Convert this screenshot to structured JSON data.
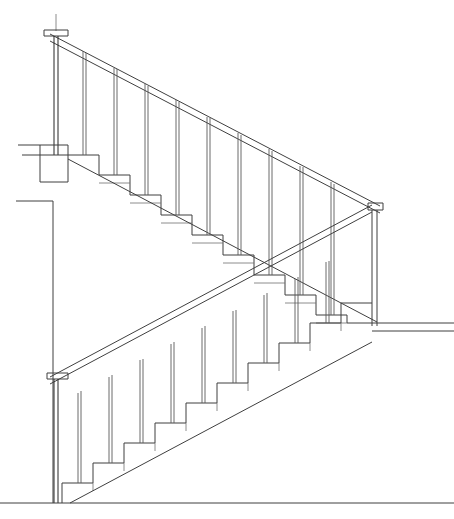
{
  "document": {
    "type": "technical-line-drawing",
    "subject": "staircase-section-elevation",
    "title": "Staircase Section Elevation",
    "background_color": "#ffffff",
    "line_color": "#3f3f3f",
    "dark_line_color": "#262626",
    "faint_line_color": "#6e6e6e",
    "canvas": {
      "width": 454,
      "height": 519
    }
  },
  "geometry": {
    "step_run": 31,
    "step_rise": 20,
    "handrail_thickness": 7,
    "baluster_width": 3,
    "newel_cap_height": 6
  },
  "upper_flight": {
    "label": "Upper flight descending left to right",
    "direction": "descending-right",
    "start_x": 68,
    "start_y": 155,
    "steps": 10,
    "newel_top": {
      "x": 44,
      "y": 30,
      "width": 24,
      "height": 6
    },
    "newel_post_x1": 54,
    "newel_post_x2": 59,
    "newel_post_top_y": 14,
    "newel_post_bottom_y": 155,
    "right_newel": {
      "x": 368,
      "y": 203,
      "width": 15,
      "height": 7
    },
    "right_newel_post_x1": 372,
    "right_newel_post_x2": 377,
    "right_newel_post_bottom_y": 326,
    "handrail_start": {
      "x": 50,
      "y": 34
    },
    "handrail_end": {
      "x": 380,
      "y": 206
    },
    "stringer_start": {
      "x": 68,
      "y": 159
    },
    "stringer_end": {
      "x": 377,
      "y": 322
    },
    "baluster_count": 9
  },
  "lower_flight": {
    "label": "Lower flight ascending left to right",
    "direction": "ascending-right",
    "start_x": 62,
    "start_y": 503,
    "steps": 10,
    "newel_top": {
      "x": 47,
      "y": 373,
      "width": 21,
      "height": 6
    },
    "newel_post_x1": 54,
    "newel_post_x2": 58,
    "newel_post_bottom_y": 503,
    "handrail_start": {
      "x": 50,
      "y": 377
    },
    "handrail_end": {
      "x": 372,
      "y": 205
    },
    "stringer_start": {
      "x": 70,
      "y": 503
    },
    "stringer_end": {
      "x": 372,
      "y": 342
    },
    "baluster_count": 9
  },
  "landing_upper": {
    "label": "Upper landing at left",
    "top_line": {
      "x1": 18,
      "y1": 145,
      "x2": 68,
      "y2": 145
    },
    "nosing_line": {
      "x1": 22,
      "y1": 155,
      "x2": 68,
      "y2": 155
    },
    "box": {
      "x": 40,
      "y": 145,
      "width": 28,
      "height": 37
    }
  },
  "wall_left": {
    "label": "Left wall section",
    "top_line": {
      "x1": 16,
      "y1": 201,
      "x2": 53,
      "y2": 201
    },
    "vertical_line": {
      "x": 53,
      "y1": 201,
      "y2": 503
    }
  },
  "floor": {
    "label": "Ground floor line",
    "y": 503,
    "x1": 0,
    "x2": 454
  },
  "landing_right": {
    "label": "Right landing / intermediate floor",
    "upper_line": {
      "x1": 377,
      "y1": 323,
      "x2": 454,
      "y2": 323
    },
    "lower_line": {
      "x1": 377,
      "y1": 331,
      "x2": 454,
      "y2": 331
    }
  },
  "elements": [
    {
      "name": "upper-handrail",
      "type": "handrail"
    },
    {
      "name": "upper-balusters",
      "type": "baluster-group"
    },
    {
      "name": "upper-treads",
      "type": "step-profile"
    },
    {
      "name": "upper-stringer",
      "type": "stringer"
    },
    {
      "name": "lower-handrail",
      "type": "handrail"
    },
    {
      "name": "lower-balusters",
      "type": "baluster-group"
    },
    {
      "name": "lower-treads",
      "type": "step-profile"
    },
    {
      "name": "lower-stringer",
      "type": "stringer"
    },
    {
      "name": "newel-post-top-left",
      "type": "newel"
    },
    {
      "name": "newel-post-right",
      "type": "newel"
    },
    {
      "name": "newel-post-bottom-left",
      "type": "newel"
    },
    {
      "name": "floor-line",
      "type": "floor"
    },
    {
      "name": "wall-left",
      "type": "wall"
    }
  ]
}
